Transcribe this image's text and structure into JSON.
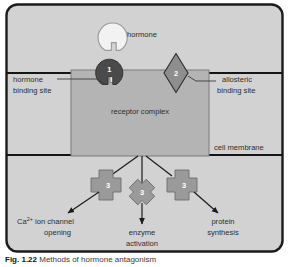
{
  "figure": {
    "caption_label": "Fig. 1.22",
    "caption_text": "Methods of hormone antagonism"
  },
  "diagram": {
    "title": "Methods of hormone antagonism",
    "hormone_label": "hormone",
    "receptor_label": "receptor complex",
    "cell_membrane_label": "cell membrane",
    "hormone_binding_site": {
      "line1": "hormone",
      "line2": "binding site"
    },
    "allosteric_binding_site": {
      "line1": "allosteric",
      "line2": "binding site"
    },
    "markers": {
      "antagonist_1": "1",
      "antagonist_2": "2",
      "antagonist_3a": "3",
      "antagonist_3b": "3",
      "antagonist_3c": "3"
    },
    "outcomes": [
      {
        "line1": "Ca",
        "sup": "2+",
        "line1b": " ion channel",
        "line2": "opening"
      },
      {
        "line1": "enzyme",
        "line2": "activation"
      },
      {
        "line1": "protein",
        "line2": "synthesis"
      }
    ],
    "outcome_left_a": "Ca",
    "outcome_left_sup": "2+",
    "outcome_left_b": " ion channel",
    "outcome_left_2": "opening",
    "outcome_mid_1": "enzyme",
    "outcome_mid_2": "activation",
    "outcome_right_1": "protein",
    "outcome_right_2": "synthesis"
  },
  "colors": {
    "page_background": "#ffffff",
    "panel_fill": "#d2d2d2",
    "panel_border": "#1b1b1b",
    "receptor_fill": "#b4b4b4",
    "receptor_stroke": "#5a5a5a",
    "membrane_line": "#151515",
    "hormone_fill": "#f2f2f2",
    "antagonist1_fill": "#4a4a4a",
    "antagonist2_fill": "#8e8e8e",
    "cross_fill": "#9a9a9a",
    "cross_stroke": "#6d6d6d",
    "text": "#2d2d2d",
    "arrow": "#1b1b1b"
  }
}
